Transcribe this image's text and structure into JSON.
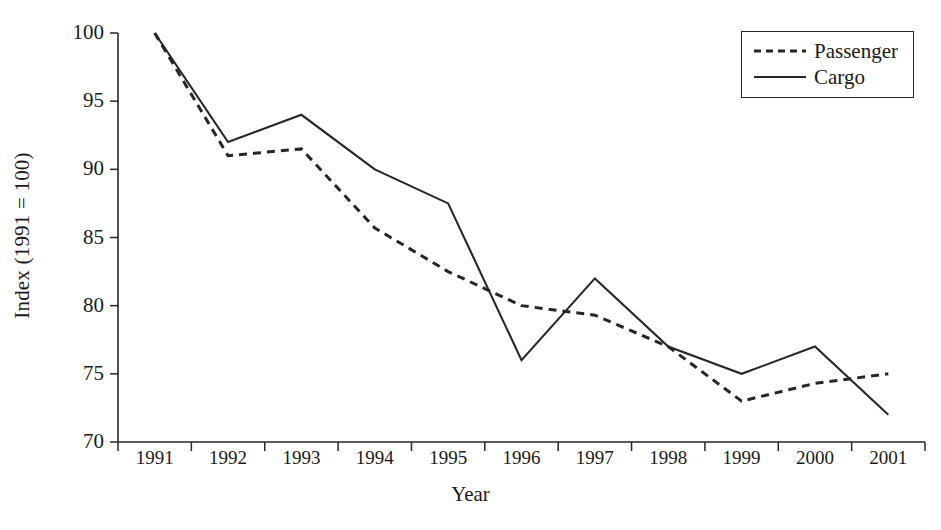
{
  "chart_data": {
    "type": "line",
    "title": "",
    "xlabel": "Year",
    "ylabel": "Index (1991 = 100)",
    "categories": [
      "1991",
      "1992",
      "1993",
      "1994",
      "1995",
      "1996",
      "1997",
      "1998",
      "1999",
      "2000",
      "2001"
    ],
    "ylim": [
      70,
      100
    ],
    "yticks": [
      70,
      75,
      80,
      85,
      90,
      95,
      100
    ],
    "ytick_labels": [
      "70",
      "75",
      "80",
      "85",
      "90",
      "95",
      "100"
    ],
    "grid": false,
    "legend_position": "top-right",
    "series": [
      {
        "name": "Passenger",
        "style": "dashed",
        "color": "#262626",
        "values": [
          100,
          91,
          91.5,
          85.7,
          82.5,
          80,
          79.3,
          77,
          73,
          74.3,
          75
        ]
      },
      {
        "name": "Cargo",
        "style": "solid",
        "color": "#262626",
        "values": [
          100,
          92,
          94,
          90,
          87.5,
          76,
          82,
          77,
          75,
          77,
          72
        ]
      }
    ]
  },
  "legend": {
    "items": [
      {
        "label": "Passenger",
        "style": "dashed"
      },
      {
        "label": "Cargo",
        "style": "solid"
      }
    ]
  },
  "axes": {
    "x_title": "Year",
    "y_title": "Index (1991 = 100)"
  }
}
